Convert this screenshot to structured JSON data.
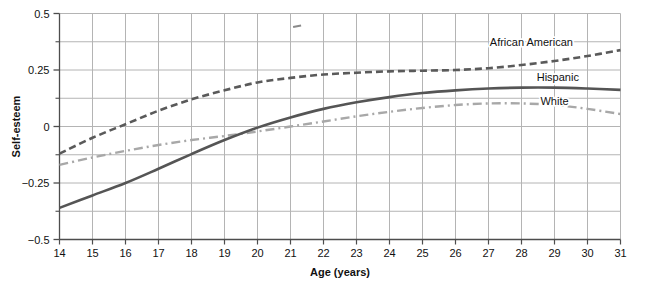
{
  "chart_data": {
    "type": "line",
    "title": "",
    "xlabel": "Age (years)",
    "ylabel": "Self-esteem",
    "xlim": [
      14,
      31
    ],
    "ylim": [
      -0.5,
      0.5
    ],
    "xticks": [
      14,
      15,
      16,
      17,
      18,
      19,
      20,
      21,
      22,
      23,
      24,
      25,
      26,
      27,
      28,
      29,
      30,
      31
    ],
    "xtick_labels": [
      "14",
      "15",
      "16",
      "17",
      "18",
      "19",
      "20",
      "21",
      "22",
      "23",
      "24",
      "25",
      "26",
      "27",
      "28",
      "29",
      "30",
      "31"
    ],
    "yticks": [
      -0.5,
      -0.25,
      0,
      0.25,
      0.5
    ],
    "ytick_labels": [
      "−0.5",
      "−0.25",
      "0",
      "0.25",
      "0.5"
    ],
    "y_minor_ticks": [
      -0.375,
      -0.125,
      0.125,
      0.375
    ],
    "grid": {
      "vertical": true,
      "horizontal": true,
      "color": "#b4b4b4",
      "horizontal_step": 0.125
    },
    "legend_position": "inline-right-of-curves",
    "x": [
      14,
      15,
      16,
      17,
      18,
      19,
      20,
      21,
      22,
      23,
      24,
      25,
      26,
      27,
      28,
      29,
      30,
      31
    ],
    "series": [
      {
        "name": "African American",
        "label": "African American",
        "style": "dashed",
        "color": "#5a5a5a",
        "width": 2.6,
        "dasharray": "7,4",
        "label_x": 28.3,
        "label_y": 0.355,
        "values": [
          -0.12,
          -0.05,
          0.01,
          0.07,
          0.12,
          0.16,
          0.195,
          0.215,
          0.23,
          0.238,
          0.244,
          0.247,
          0.25,
          0.258,
          0.272,
          0.29,
          0.312,
          0.338
        ]
      },
      {
        "name": "Hispanic",
        "label": "Hispanic",
        "style": "solid",
        "color": "#555555",
        "width": 2.6,
        "dasharray": "none",
        "label_x": 29.1,
        "label_y": 0.2,
        "values": [
          -0.36,
          -0.305,
          -0.25,
          -0.187,
          -0.122,
          -0.06,
          -0.005,
          0.04,
          0.078,
          0.107,
          0.13,
          0.148,
          0.16,
          0.168,
          0.172,
          0.172,
          0.168,
          0.162
        ]
      },
      {
        "name": "White",
        "label": "White",
        "style": "dashdot",
        "color": "#a8a8a8",
        "width": 2.4,
        "dasharray": "9,4,2,4",
        "label_x": 29.0,
        "label_y": 0.095,
        "values": [
          -0.17,
          -0.137,
          -0.108,
          -0.082,
          -0.06,
          -0.042,
          -0.022,
          0.0,
          0.022,
          0.045,
          0.065,
          0.082,
          0.095,
          0.102,
          0.102,
          0.095,
          0.078,
          0.055
        ]
      }
    ],
    "stray_mark": {
      "x": 21.2,
      "y": 0.44
    }
  }
}
